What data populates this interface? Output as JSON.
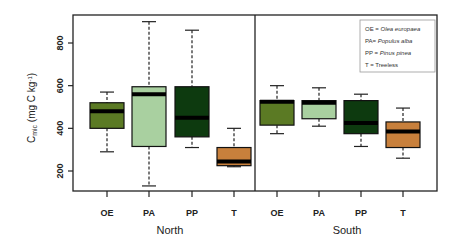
{
  "chart_data": {
    "type": "boxplot",
    "title": "",
    "xlabel": "",
    "ylabel": "C_mic (mg C kg^-1)",
    "ylabel_parts": {
      "main": "C",
      "sub": "mic",
      "unit_open": " (mg C kg",
      "sup": "-1",
      "unit_close": ")"
    },
    "ylim": [
      100,
      950
    ],
    "yticks": [
      200,
      400,
      600,
      800
    ],
    "grid": false,
    "groups": [
      "North",
      "South"
    ],
    "categories": [
      "OE",
      "PA",
      "PP",
      "T"
    ],
    "colors": {
      "OE": "#5b7a24",
      "PA": "#a9d0a0",
      "PP": "#0d3a0f",
      "T": "#c8803c"
    },
    "series": [
      {
        "group": "North",
        "category": "OE",
        "whisker_low": 290,
        "q1": 400,
        "median": 480,
        "q3": 520,
        "whisker_high": 570
      },
      {
        "group": "North",
        "category": "PA",
        "whisker_low": 130,
        "q1": 315,
        "median": 560,
        "q3": 595,
        "whisker_high": 900
      },
      {
        "group": "North",
        "category": "PP",
        "whisker_low": 310,
        "q1": 360,
        "median": 450,
        "q3": 595,
        "whisker_high": 860
      },
      {
        "group": "North",
        "category": "T",
        "whisker_low": 220,
        "q1": 225,
        "median": 245,
        "q3": 310,
        "whisker_high": 400
      },
      {
        "group": "South",
        "category": "OE",
        "whisker_low": 375,
        "q1": 415,
        "median": 525,
        "q3": 530,
        "whisker_high": 600
      },
      {
        "group": "South",
        "category": "PA",
        "whisker_low": 410,
        "q1": 445,
        "median": 520,
        "q3": 530,
        "whisker_high": 590
      },
      {
        "group": "South",
        "category": "PP",
        "whisker_low": 315,
        "q1": 375,
        "median": 425,
        "q3": 530,
        "whisker_high": 560
      },
      {
        "group": "South",
        "category": "T",
        "whisker_low": 260,
        "q1": 310,
        "median": 385,
        "q3": 430,
        "whisker_high": 495
      }
    ],
    "legend": {
      "position": "top-right",
      "entries": [
        {
          "code": "OE = ",
          "name": "Olea europaea"
        },
        {
          "code": "PA= ",
          "name": "Populus alba"
        },
        {
          "code": "PP = ",
          "name": "Pinus pinea"
        },
        {
          "code": "T = ",
          "name": "Treeless"
        }
      ]
    }
  }
}
